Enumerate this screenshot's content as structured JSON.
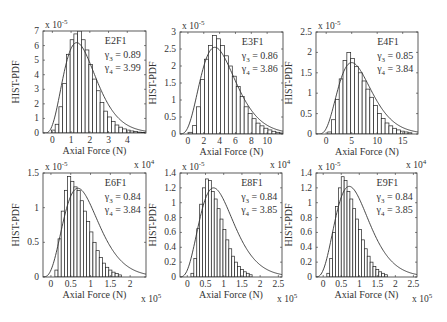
{
  "figure": {
    "width": 447,
    "height": 322,
    "bar_fill": "#ffffff",
    "bar_stroke": "#222222",
    "curve_color": "#333333",
    "axis_color": "#333333"
  },
  "chart_data": [
    {
      "type": "bar",
      "panel": "E2F1",
      "title": "",
      "label": "E2F1",
      "gamma3_label": "γ3 = 0.89",
      "gamma4_label": "γ4 = 3.99",
      "gamma3": 0.89,
      "gamma4": 3.99,
      "xlabel": "Axial Force (N)",
      "ylabel": "HIST-PDF",
      "y_exponent": "x 10-5",
      "x_exponent": "x 10^4",
      "x_exponent_pos": "top-right-of-previous",
      "xlim": [
        -0.5,
        5
      ],
      "ylim": [
        0,
        7
      ],
      "xticks": [
        0,
        1,
        2,
        3,
        4
      ],
      "yticks": [
        0,
        1,
        2,
        3,
        4,
        5,
        6,
        7
      ],
      "hist": {
        "bin_start": -0.05,
        "bin_width": 0.2,
        "values": [
          0.2,
          0.6,
          1.8,
          3.4,
          5.4,
          6.4,
          6.8,
          7.0,
          6.4,
          5.7,
          4.7,
          3.7,
          2.9,
          2.1,
          1.5,
          1.1,
          0.8,
          0.55,
          0.4,
          0.28,
          0.2,
          0.14,
          0.1,
          0.06,
          0.04
        ]
      },
      "fit": {
        "peak_x": 1.3,
        "peak_y": 6.2,
        "shape": 5.0
      },
      "box": {
        "x": 43,
        "y": 31,
        "w": 103,
        "h": 102
      }
    },
    {
      "type": "bar",
      "panel": "E3F1",
      "label": "E3F1",
      "gamma3_label": "γ3 = 0.86",
      "gamma4_label": "γ4 = 3.86",
      "gamma3": 0.86,
      "gamma4": 3.86,
      "xlabel": "Axial Force (N)",
      "ylabel": "HIST-PDF",
      "y_exponent": "x 10-5",
      "xlim": [
        -1,
        12
      ],
      "ylim": [
        0,
        3
      ],
      "xticks": [
        0,
        2,
        4,
        6,
        8,
        10
      ],
      "yticks": [
        0,
        0.5,
        1,
        1.5,
        2,
        2.5,
        3
      ],
      "hist": {
        "bin_start": 0.1,
        "bin_width": 0.5,
        "values": [
          0.05,
          0.25,
          0.8,
          1.6,
          2.2,
          2.6,
          2.9,
          2.8,
          2.6,
          2.3,
          2.0,
          1.7,
          1.4,
          1.1,
          0.8,
          0.6,
          0.45,
          0.32,
          0.24,
          0.17,
          0.12,
          0.08,
          0.05,
          0.03
        ]
      },
      "fit": {
        "peak_x": 3.4,
        "peak_y": 2.55,
        "shape": 5.2
      },
      "box": {
        "x": 180,
        "y": 32,
        "w": 103,
        "h": 102
      }
    },
    {
      "type": "bar",
      "panel": "E4F1",
      "label": "E4F1",
      "gamma3_label": "γ3 = 0.85",
      "gamma4_label": "γ4 = 3.84",
      "gamma3": 0.85,
      "gamma4": 3.84,
      "xlabel": "Axial Force (N)",
      "ylabel": "HIST-PDF",
      "y_exponent": "x 10-5",
      "xlim": [
        -2,
        18
      ],
      "ylim": [
        0,
        2.5
      ],
      "xticks": [
        0,
        5,
        10,
        15
      ],
      "yticks": [
        0,
        0.5,
        1,
        1.5,
        2,
        2.5
      ],
      "hist": {
        "bin_start": 0.3,
        "bin_width": 0.75,
        "values": [
          0.05,
          0.35,
          0.85,
          1.35,
          1.8,
          2.0,
          1.85,
          1.65,
          1.5,
          1.3,
          1.1,
          0.9,
          0.7,
          0.5,
          0.38,
          0.27,
          0.2,
          0.14,
          0.1,
          0.07,
          0.05,
          0.03
        ]
      },
      "fit": {
        "peak_x": 5.0,
        "peak_y": 1.75,
        "shape": 5.2
      },
      "box": {
        "x": 316,
        "y": 32,
        "w": 102,
        "h": 102
      }
    },
    {
      "type": "bar",
      "panel": "E6F1",
      "label": "E6F1",
      "gamma3_label": "γ3 = 0.84",
      "gamma4_label": "γ4 = 3.84",
      "gamma3": 0.84,
      "gamma4": 3.84,
      "xlabel": "Axial Force (N)",
      "ylabel": "HIST-PDF",
      "y_exponent": "x 10-5",
      "x_exponent": "x 10^5",
      "xlim": [
        -0.2,
        2.4
      ],
      "ylim": [
        0,
        1.5
      ],
      "xticks": [
        0,
        0.5,
        1,
        1.5,
        2
      ],
      "yticks": [
        0,
        0.5,
        1,
        1.5
      ],
      "hist": {
        "bin_start": 0.1,
        "bin_width": 0.08,
        "values": [
          0.1,
          0.55,
          0.95,
          1.25,
          1.45,
          1.38,
          1.3,
          1.25,
          1.1,
          0.95,
          0.8,
          0.65,
          0.5,
          0.38,
          0.28,
          0.2,
          0.14,
          0.1,
          0.07,
          0.05,
          0.03
        ]
      },
      "fit": {
        "peak_x": 0.68,
        "peak_y": 1.28,
        "shape": 5.2
      },
      "box": {
        "x": 43,
        "y": 173,
        "w": 103,
        "h": 104
      }
    },
    {
      "type": "bar",
      "panel": "E8F1",
      "label": "E8F1",
      "gamma3_label": "γ3 = 0.84",
      "gamma4_label": "γ4 = 3.85",
      "gamma3": 0.84,
      "gamma4": 3.85,
      "xlabel": "Axial Force (N)",
      "ylabel": "HIST-PDF",
      "y_exponent": "x 10-5",
      "x_exponent": "x 10^5",
      "xlim": [
        -0.2,
        2.6
      ],
      "ylim": [
        0,
        1.4
      ],
      "xticks": [
        0,
        0.5,
        1,
        1.5,
        2,
        2.5
      ],
      "yticks": [
        0,
        0.2,
        0.4,
        0.6,
        0.8,
        1,
        1.2,
        1.4
      ],
      "hist": {
        "bin_start": 0.1,
        "bin_width": 0.08,
        "values": [
          0.05,
          0.25,
          0.65,
          0.98,
          1.2,
          1.32,
          1.3,
          1.15,
          1.05,
          0.92,
          0.78,
          0.64,
          0.5,
          0.38,
          0.28,
          0.2,
          0.14,
          0.1,
          0.07,
          0.05,
          0.03
        ]
      },
      "fit": {
        "peak_x": 0.72,
        "peak_y": 1.2,
        "shape": 5.2
      },
      "box": {
        "x": 180,
        "y": 173,
        "w": 102,
        "h": 104
      }
    },
    {
      "type": "bar",
      "panel": "E9F1",
      "label": "E9F1",
      "gamma3_label": "γ3 = 0.84",
      "gamma4_label": "γ4 = 3.85",
      "gamma3": 0.84,
      "gamma4": 3.85,
      "xlabel": "Axial Force (N)",
      "ylabel": "HIST-PDF",
      "y_exponent": "x 10-5",
      "x_exponent": "x 10^5",
      "xlim": [
        -0.2,
        2.6
      ],
      "ylim": [
        0,
        1.4
      ],
      "xticks": [
        0,
        0.5,
        1,
        1.5,
        2,
        2.5
      ],
      "yticks": [
        0,
        0.2,
        0.4,
        0.6,
        0.8,
        1,
        1.2,
        1.4
      ],
      "hist": {
        "bin_start": 0.1,
        "bin_width": 0.08,
        "values": [
          0.05,
          0.25,
          0.6,
          0.95,
          1.2,
          1.35,
          1.3,
          1.15,
          1.05,
          0.92,
          0.78,
          0.64,
          0.5,
          0.38,
          0.28,
          0.2,
          0.14,
          0.1,
          0.07,
          0.05,
          0.03
        ]
      },
      "fit": {
        "peak_x": 0.72,
        "peak_y": 1.22,
        "shape": 5.2
      },
      "box": {
        "x": 316,
        "y": 173,
        "w": 101,
        "h": 104
      }
    }
  ],
  "extra_exponent_labels": [
    {
      "text": "x 10",
      "sup": "4",
      "x": 134,
      "y": 168,
      "panel_ref": "E6F1-top"
    },
    {
      "text": "x 10",
      "sup": "4",
      "x": 270,
      "y": 168,
      "panel_ref": "E8F1-top"
    },
    {
      "text": "x 10",
      "sup": "4",
      "x": 406,
      "y": 168,
      "panel_ref": "E9F1-top"
    }
  ]
}
